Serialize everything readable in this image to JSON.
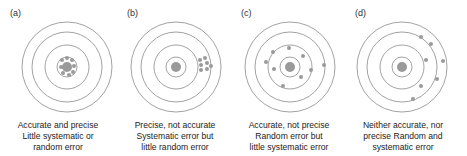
{
  "figure": {
    "colors": {
      "ring": "#8a8a8a",
      "bullseye": "#9a9a9a",
      "dot": "#9a9a9a",
      "text": "#222222"
    },
    "ring_radii": [
      45,
      35,
      22,
      10
    ],
    "bullseye_radius": 5,
    "dot_radius": 2,
    "panels": [
      {
        "label": "(a)",
        "caption": [
          "Accurate and precise",
          "Little systematic or",
          "random error"
        ],
        "offset_x": 0,
        "center": [
          67,
          67
        ],
        "dots": [
          [
            62,
            60
          ],
          [
            67,
            58
          ],
          [
            72,
            60
          ],
          [
            61,
            67
          ],
          [
            74,
            66
          ],
          [
            63,
            73
          ],
          [
            69,
            75
          ],
          [
            73,
            72
          ]
        ]
      },
      {
        "label": "(b)",
        "caption": [
          "Precise, not accurate",
          "Systematic error but",
          "little random error"
        ],
        "offset_x": 114,
        "center": [
          176,
          67
        ],
        "dots": [
          [
            200,
            60
          ],
          [
            205,
            58
          ],
          [
            201,
            65
          ],
          [
            207,
            63
          ],
          [
            201,
            70
          ],
          [
            207,
            69
          ],
          [
            211,
            66
          ]
        ]
      },
      {
        "label": "(c)",
        "caption": [
          "Accurate, not precise",
          "Random error but",
          "little systematic error"
        ],
        "offset_x": 228,
        "center": [
          290,
          67
        ],
        "dots": [
          [
            273,
            52
          ],
          [
            289,
            48
          ],
          [
            303,
            56
          ],
          [
            266,
            62
          ],
          [
            274,
            69
          ],
          [
            311,
            70
          ],
          [
            324,
            65
          ],
          [
            301,
            77
          ],
          [
            283,
            86
          ]
        ]
      },
      {
        "label": "(d)",
        "caption": [
          "Neither accurate, nor",
          "precise Random and",
          "systematic error"
        ],
        "offset_x": 342,
        "center": [
          402,
          67
        ],
        "dots": [
          [
            421,
            37
          ],
          [
            431,
            44
          ],
          [
            426,
            60
          ],
          [
            443,
            61
          ],
          [
            437,
            79
          ],
          [
            421,
            86
          ],
          [
            413,
            99
          ]
        ]
      }
    ]
  }
}
